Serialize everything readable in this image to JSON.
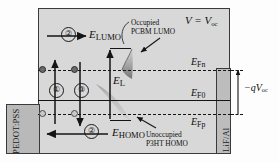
{
  "figure": {
    "type": "energy-band-diagram",
    "condition_label": "V = V",
    "condition_sub": "oc"
  },
  "contacts": {
    "left": {
      "name": "PEDOT:PSS"
    },
    "right": {
      "name": "LiF/Al"
    }
  },
  "levels": [
    {
      "id": "efn",
      "label": "E",
      "sub": "Fn",
      "style": "dashed",
      "y": 70
    },
    {
      "id": "ef0",
      "label": "E",
      "sub": "F0",
      "style": "solid",
      "y": 100
    },
    {
      "id": "efp",
      "label": "E",
      "sub": "Fp",
      "style": "dashed",
      "y": 114
    }
  ],
  "band_labels": {
    "lumo": {
      "label": "E",
      "sub": "LUMO"
    },
    "homo": {
      "label": "E",
      "sub": "HOMO"
    },
    "el": {
      "label": "E",
      "sub": "L"
    }
  },
  "voltage_annotation": {
    "label": "−qV",
    "sub": "oc"
  },
  "process_numbers": [
    {
      "id": "1",
      "text": "①"
    },
    {
      "id": "2-top",
      "text": "②"
    },
    {
      "id": "3",
      "text": "③"
    },
    {
      "id": "2-bottom",
      "text": "②"
    }
  ],
  "annotations": [
    {
      "id": "occupied-pcbm",
      "line1": "Occupied",
      "line2": "PCBM LUMO"
    },
    {
      "id": "unoccupied-p3ht",
      "line1": "Unoccupied",
      "line2": "P3HT HOMO"
    }
  ],
  "carriers": [
    {
      "id": "electron-1",
      "kind": "filled"
    },
    {
      "id": "electron-2",
      "kind": "filled"
    },
    {
      "id": "hole-1",
      "kind": "hollow"
    },
    {
      "id": "hole-2",
      "kind": "hollow"
    }
  ],
  "colors": {
    "active_layer": "#d8d8d8",
    "electrode": "#bdbdbd",
    "line": "#141414",
    "dot_filled": "#6a6a6a",
    "dot_hollow": "#c9c9c9"
  }
}
